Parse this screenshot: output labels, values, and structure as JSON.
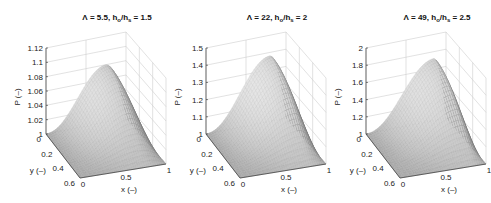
{
  "chart_data": [
    {
      "type": "surface",
      "title": "Λ = 5.5, h_o/h_s = 1.5",
      "title_parts": {
        "lambda": "Λ = 5.5, ",
        "h1": "h",
        "s1": "o",
        "slash": "/",
        "h2": "h",
        "s2": "s",
        "ratio": " = 1.5"
      },
      "xlabel": "x (–)",
      "ylabel": "y (–)",
      "zlabel": "P (–)",
      "xlim": [
        0,
        1
      ],
      "ylim": [
        0,
        0.6
      ],
      "zlim": [
        1,
        1.12
      ],
      "xticks": [
        "0",
        "0.5",
        "1"
      ],
      "yticks": [
        "0",
        "0.2",
        "0.4",
        "0.6"
      ],
      "zticks": [
        "1",
        "1.02",
        "1.04",
        "1.06",
        "1.08",
        "1.1",
        "1.12"
      ],
      "peak": {
        "x": 0.75,
        "y": 0.0,
        "P": 1.08
      },
      "grid": true
    },
    {
      "type": "surface",
      "title": "Λ = 22, h_o/h_s = 2",
      "title_parts": {
        "lambda": "Λ = 22, ",
        "h1": "h",
        "s1": "o",
        "slash": "/",
        "h2": "h",
        "s2": "s",
        "ratio": " = 2"
      },
      "xlabel": "x (–)",
      "ylabel": "y (–)",
      "zlabel": "P (–)",
      "xlim": [
        0,
        1
      ],
      "ylim": [
        0,
        0.6
      ],
      "zlim": [
        1,
        1.5
      ],
      "xticks": [
        "0",
        "0.5",
        "1"
      ],
      "yticks": [
        "0",
        "0.2",
        "0.4",
        "0.6"
      ],
      "zticks": [
        "1",
        "1.1",
        "1.2",
        "1.3",
        "1.4",
        "1.5"
      ],
      "peak": {
        "x": 0.8,
        "y": 0.0,
        "P": 1.38
      },
      "grid": true
    },
    {
      "type": "surface",
      "title": "Λ = 49, h_o/h_s = 2.5",
      "title_parts": {
        "lambda": "Λ = 49, ",
        "h1": "h",
        "s1": "o",
        "slash": "/",
        "h2": "h",
        "s2": "s",
        "ratio": " = 2.5"
      },
      "xlabel": "x (–)",
      "ylabel": "y (–)",
      "zlabel": "P (–)",
      "xlim": [
        0,
        1
      ],
      "ylim": [
        0,
        0.6
      ],
      "zlim": [
        1,
        2
      ],
      "xticks": [
        "0",
        "0.5",
        "1"
      ],
      "yticks": [
        "0",
        "0.2",
        "0.4",
        "0.6"
      ],
      "zticks": [
        "1",
        "1.2",
        "1.4",
        "1.6",
        "1.8",
        "2"
      ],
      "peak": {
        "x": 0.85,
        "y": 0.0,
        "P": 1.72
      },
      "grid": true
    }
  ],
  "panels": [
    {
      "ox": 0
    },
    {
      "ox": 160
    },
    {
      "ox": 320
    }
  ]
}
